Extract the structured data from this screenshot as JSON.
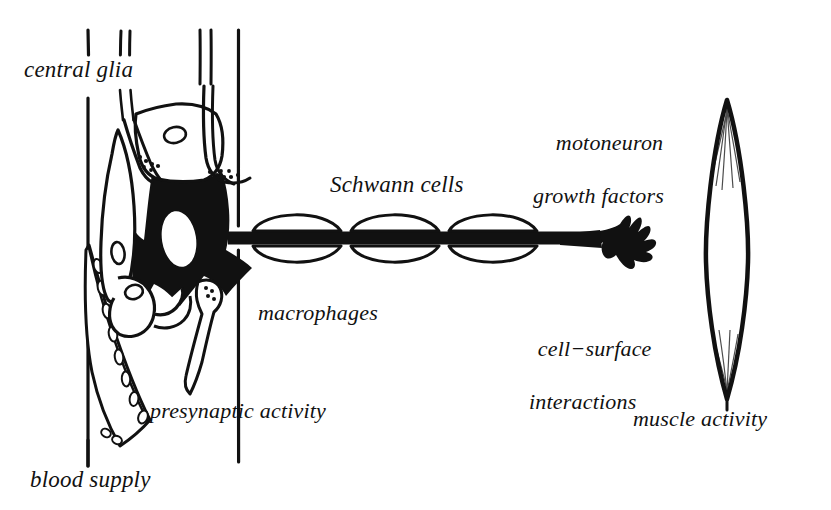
{
  "figure": {
    "kind": "scientific-line-diagram",
    "ink_color": "#111111",
    "background_color": "#ffffff",
    "width": 831,
    "height": 510
  },
  "labels": {
    "central_glia": "central glia",
    "blood_supply": "blood supply",
    "presynaptic_activity": "presynaptic activity",
    "macrophages": "macrophages",
    "schwann_cells": "Schwann cells",
    "motoneuron_line1": "motoneuron",
    "motoneuron_line2": "growth factors",
    "cell_surface_line1": "cell−surface",
    "cell_surface_line2": "interactions",
    "muscle_activity": "muscle activity"
  },
  "structures": {
    "soma": "neuron-cell-body",
    "nucleus": "neuron-nucleus",
    "axon": "axon",
    "nerve_terminal": "nerve-terminal-arbor",
    "muscle_fiber": "muscle-fiber",
    "blood_vessel": "blood-vessel",
    "glial_cell_upper": "glial-cell-upper",
    "glial_cell_left": "glial-cell-left",
    "presynaptic_terminal_upper": "presynaptic-terminal-upper",
    "presynaptic_terminal_right": "presynaptic-terminal-right",
    "presynaptic_terminal_lower": "presynaptic-terminal-lower",
    "schwann_cell_count": 6,
    "boundary_line_left": "cns-boundary-line-left",
    "boundary_line_right": "cns-boundary-line-right"
  }
}
